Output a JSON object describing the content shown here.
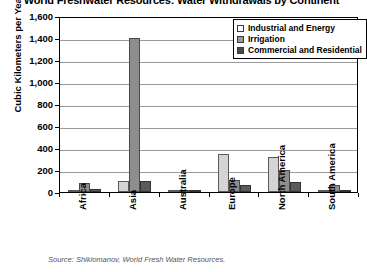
{
  "chart_data": {
    "type": "bar",
    "title": "World Freshwater Resources: Water Withdrawals by Continent",
    "xlabel": "",
    "ylabel": "Cubic Kilometers per Year",
    "ylim": [
      0,
      1600
    ],
    "ytick_labels": [
      "1,600",
      "1,400",
      "1,200",
      "1,000",
      "800",
      "600",
      "400",
      "200",
      "0"
    ],
    "ytick_values": [
      1600,
      1400,
      1200,
      1000,
      800,
      600,
      400,
      200,
      0
    ],
    "grid": true,
    "legend_position": "top-right",
    "categories": [
      "Africa",
      "Asia",
      "Australia",
      "Europe",
      "North America",
      "South America"
    ],
    "series": [
      {
        "name": "Industrial and Energy",
        "color": "#d4d4d4",
        "values": [
          20,
          100,
          10,
          350,
          320,
          20
        ]
      },
      {
        "name": "Irrigation",
        "color": "#8e8e8e",
        "values": [
          80,
          1400,
          20,
          110,
          200,
          60
        ]
      },
      {
        "name": "Commercial and Residential",
        "color": "#5a5a5a",
        "values": [
          25,
          100,
          10,
          60,
          90,
          20
        ]
      }
    ],
    "source": "Source: Shiklomanov, World Fresh Water Resources."
  }
}
